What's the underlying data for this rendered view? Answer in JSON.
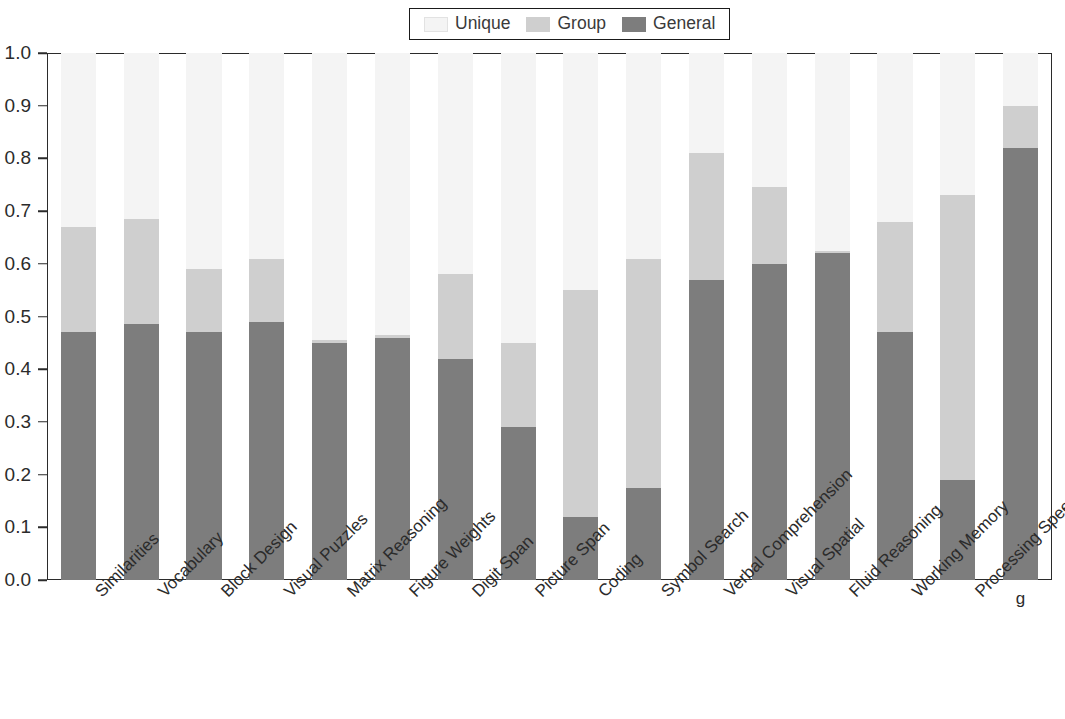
{
  "chart_data": {
    "type": "bar",
    "subtype": "stacked-bar",
    "title": "",
    "subtitle": "",
    "xlabel": "",
    "ylabel": "",
    "ylim": [
      0.0,
      1.0
    ],
    "ytick_labels": [
      "0.0",
      "0.1",
      "0.2",
      "0.3",
      "0.4",
      "0.5",
      "0.6",
      "0.7",
      "0.8",
      "0.9",
      "1.0"
    ],
    "ytick_values": [
      0.0,
      0.1,
      0.2,
      0.3,
      0.4,
      0.5,
      0.6,
      0.7,
      0.8,
      0.9,
      1.0
    ],
    "grid": false,
    "legend_position": "top-center",
    "stack_order_bottom_to_top": [
      "General",
      "Group",
      "Unique"
    ],
    "categories": [
      "Similarities",
      "Vocabulary",
      "Block Design",
      "Visual Puzzles",
      "Matrix Reasoning",
      "Figure Weights",
      "Digit Span",
      "Picture Span",
      "Coding",
      "Symbol Search",
      "Verbal Comprehension",
      "Visual Spatial",
      "Fluid Reasoning",
      "Working Memory",
      "Processing Speed",
      "g"
    ],
    "series": [
      {
        "name": "General",
        "color": "#7d7d7d",
        "values": [
          0.47,
          0.485,
          0.47,
          0.49,
          0.45,
          0.46,
          0.42,
          0.29,
          0.12,
          0.175,
          0.57,
          0.6,
          0.62,
          0.47,
          0.19,
          0.82
        ]
      },
      {
        "name": "Group",
        "color": "#cfcfcf",
        "values": [
          0.2,
          0.2,
          0.12,
          0.12,
          0.005,
          0.005,
          0.16,
          0.16,
          0.43,
          0.435,
          0.24,
          0.145,
          0.005,
          0.21,
          0.54,
          0.08
        ]
      },
      {
        "name": "Unique",
        "color": "#f4f4f4",
        "values": [
          0.33,
          0.315,
          0.41,
          0.39,
          0.545,
          0.535,
          0.42,
          0.55,
          0.45,
          0.39,
          0.19,
          0.255,
          0.375,
          0.32,
          0.27,
          0.1
        ]
      }
    ],
    "stack_tops": {
      "general_plus_group": [
        0.67,
        0.685,
        0.59,
        0.61,
        0.455,
        0.465,
        0.58,
        0.45,
        0.55,
        0.61,
        0.81,
        0.745,
        0.625,
        0.68,
        0.73,
        0.9
      ],
      "total": [
        1.0,
        1.0,
        1.0,
        1.0,
        1.0,
        1.0,
        1.0,
        1.0,
        1.0,
        1.0,
        1.0,
        1.0,
        1.0,
        1.0,
        1.0,
        1.0
      ]
    }
  },
  "legend": {
    "entries": [
      {
        "label": "Unique",
        "color": "#f4f4f4"
      },
      {
        "label": "Group",
        "color": "#cfcfcf"
      },
      {
        "label": "General",
        "color": "#7d7d7d"
      }
    ]
  }
}
